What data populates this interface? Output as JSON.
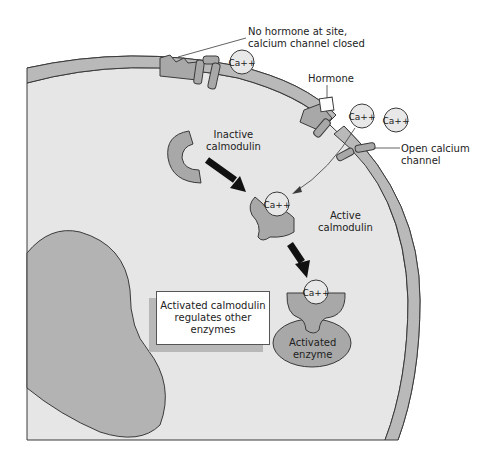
{
  "diagram": {
    "type": "cell-signaling-illustration",
    "labels": {
      "no_hormone": [
        "No hormone at site,",
        "calcium channel closed"
      ],
      "hormone": "Hormone",
      "open_channel": [
        "Open calcium",
        "channel"
      ],
      "inactive_calmodulin": [
        "Inactive",
        "calmodulin"
      ],
      "active_calmodulin": [
        "Active",
        "calmodulin"
      ],
      "activated_enzyme": [
        "Activated",
        "enzyme"
      ],
      "callout": [
        "Activated calmodulin",
        "regulates other",
        "enzymes"
      ]
    },
    "ion_label": "Ca++",
    "colors": {
      "membrane": "#b9b9b9",
      "cytoplasm": "#e6e6e6",
      "protein": "#a8a8a8",
      "nucleus": "#b3b3b3",
      "ion": "#e8e8e8",
      "outline": "#3a3a3a",
      "arrow": "#111111"
    }
  }
}
